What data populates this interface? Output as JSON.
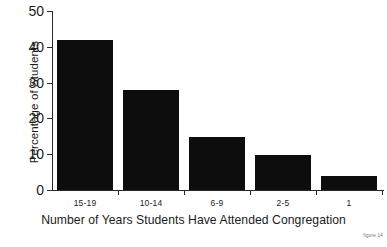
{
  "chart_data": {
    "type": "bar",
    "title": "",
    "subtitle": "",
    "categories": [
      "15-19",
      "10-14",
      "6-9",
      "2-5",
      "1"
    ],
    "values": [
      42,
      28,
      14.8,
      9.7,
      3.8
    ],
    "xlabel": "Number of Years Students Have Attended Congregation",
    "ylabel": "Percentage of Students",
    "ylim": [
      0,
      50
    ],
    "yticks": [
      0,
      10,
      20,
      30,
      40,
      50
    ],
    "ytick_labels": [
      "0",
      "10",
      "20",
      "30",
      "40",
      "50"
    ],
    "grid": false,
    "legend": false,
    "legend_position": "none",
    "bar_color": "#0d0d0d",
    "axis_color": "#2b2b2b",
    "background_color": "#ffffff"
  },
  "caption": {
    "text": "figure 14"
  }
}
